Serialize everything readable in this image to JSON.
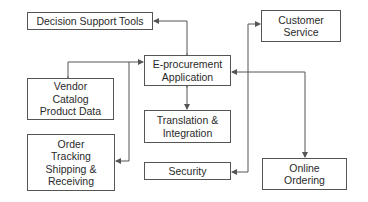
{
  "diagram": {
    "type": "system-architecture",
    "center_node": "E-procurement Application",
    "nodes": [
      {
        "id": "dst",
        "lines": [
          "Decision Support Tools"
        ]
      },
      {
        "id": "cs",
        "lines": [
          "Customer",
          "Service"
        ]
      },
      {
        "id": "eproc",
        "lines": [
          "E-procurement",
          "Application"
        ]
      },
      {
        "id": "vendor",
        "lines": [
          "Vendor",
          "Catalog",
          "Product Data"
        ]
      },
      {
        "id": "trans",
        "lines": [
          "Translation &",
          "Integration"
        ]
      },
      {
        "id": "order",
        "lines": [
          "Order",
          "Tracking",
          "Shipping &",
          "Receiving"
        ]
      },
      {
        "id": "sec",
        "lines": [
          "Security"
        ]
      },
      {
        "id": "online",
        "lines": [
          "Online",
          "Ordering"
        ]
      }
    ],
    "edges": [
      {
        "from": "eproc",
        "to": "dst",
        "arrows": "both"
      },
      {
        "from": "eproc",
        "to": "vendor",
        "arrows": "both"
      },
      {
        "from": "eproc",
        "to": "order",
        "arrows": "both"
      },
      {
        "from": "eproc",
        "to": "trans",
        "arrows": "both"
      },
      {
        "from": "eproc",
        "to": "cs",
        "arrows": "both"
      },
      {
        "from": "eproc",
        "to": "sec",
        "arrows": "both"
      },
      {
        "from": "eproc",
        "to": "online",
        "arrows": "both"
      }
    ],
    "colors": {
      "line": "#555555",
      "text": "#2a2a2a",
      "background": "#ffffff"
    }
  }
}
